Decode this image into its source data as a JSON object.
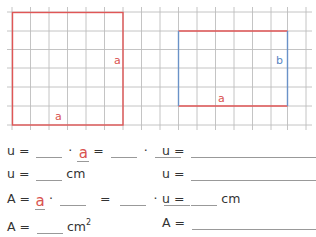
{
  "figure": {
    "grid": {
      "color": "#bbbbbb",
      "spacing_px": 18.5,
      "x_start": 12,
      "y_start": 12,
      "columns": 17,
      "rows": 7
    },
    "square": {
      "label_side": "a",
      "label_bottom": "a",
      "color": "#e05656",
      "cells_wide": 6,
      "cells_high": 6
    },
    "rectangle": {
      "label_right": "b",
      "label_bottom": "a",
      "horizontal_color": "#e05656",
      "vertical_color": "#6a92c8",
      "cells_wide": 6,
      "cells_high": 4
    }
  },
  "left_exercises": [
    {
      "prefix": "u =",
      "dot": "·",
      "filled": "a",
      "equals": "=",
      "dot2": "·"
    },
    {
      "prefix": "u =",
      "unit": "cm"
    },
    {
      "prefix": "A =",
      "filled": "a",
      "dot": "·",
      "equals": "=",
      "dot2": "·"
    },
    {
      "prefix": "A =",
      "unit": "cm",
      "unit_sup": "2"
    }
  ],
  "right_exercises": [
    {
      "prefix": "u ="
    },
    {
      "prefix": "u ="
    },
    {
      "prefix": "u =",
      "unit": "cm"
    },
    {
      "prefix": "A ="
    }
  ]
}
